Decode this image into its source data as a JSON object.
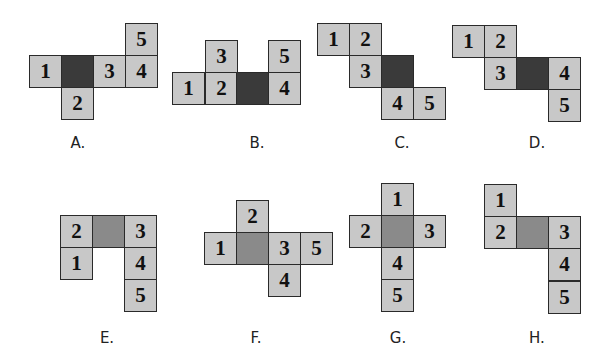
{
  "colors": {
    "face": "#c8c8c8",
    "shaded_dark": "#3a3a3a",
    "shaded_mid": "#8a8a8a",
    "border": "#2a2a2a",
    "background": "#ffffff"
  },
  "figures": [
    {
      "label": "A.",
      "label_pos": [
        78,
        134
      ],
      "squares": [
        {
          "text": "5",
          "x": 125,
          "y": 23,
          "shade": "none"
        },
        {
          "text": "1",
          "x": 29,
          "y": 55,
          "shade": "none"
        },
        {
          "text": "",
          "x": 61,
          "y": 55,
          "shade": "dark"
        },
        {
          "text": "3",
          "x": 93,
          "y": 55,
          "shade": "none"
        },
        {
          "text": "4",
          "x": 125,
          "y": 55,
          "shade": "none"
        },
        {
          "text": "2",
          "x": 61,
          "y": 87,
          "shade": "none"
        }
      ]
    },
    {
      "label": "B.",
      "label_pos": [
        257,
        134
      ],
      "squares": [
        {
          "text": "3",
          "x": 205,
          "y": 40,
          "shade": "none"
        },
        {
          "text": "5",
          "x": 268,
          "y": 40,
          "shade": "none"
        },
        {
          "text": "1",
          "x": 172,
          "y": 72,
          "shade": "none"
        },
        {
          "text": "2",
          "x": 205,
          "y": 72,
          "shade": "none"
        },
        {
          "text": "",
          "x": 236,
          "y": 72,
          "shade": "dark"
        },
        {
          "text": "4",
          "x": 268,
          "y": 72,
          "shade": "none"
        }
      ]
    },
    {
      "label": "C.",
      "label_pos": [
        402,
        134
      ],
      "squares": [
        {
          "text": "1",
          "x": 317,
          "y": 23,
          "shade": "none"
        },
        {
          "text": "2",
          "x": 349,
          "y": 23,
          "shade": "none"
        },
        {
          "text": "3",
          "x": 349,
          "y": 55,
          "shade": "none"
        },
        {
          "text": "",
          "x": 381,
          "y": 55,
          "shade": "dark"
        },
        {
          "text": "4",
          "x": 381,
          "y": 87,
          "shade": "none"
        },
        {
          "text": "5",
          "x": 413,
          "y": 87,
          "shade": "none"
        }
      ]
    },
    {
      "label": "D.",
      "label_pos": [
        537,
        134
      ],
      "squares": [
        {
          "text": "1",
          "x": 452,
          "y": 25,
          "shade": "none"
        },
        {
          "text": "2",
          "x": 484,
          "y": 25,
          "shade": "none"
        },
        {
          "text": "3",
          "x": 484,
          "y": 57,
          "shade": "none"
        },
        {
          "text": "",
          "x": 516,
          "y": 57,
          "shade": "dark"
        },
        {
          "text": "4",
          "x": 548,
          "y": 57,
          "shade": "none"
        },
        {
          "text": "5",
          "x": 548,
          "y": 89,
          "shade": "none"
        }
      ]
    },
    {
      "label": "E.",
      "label_pos": [
        107,
        329
      ],
      "squares": [
        {
          "text": "2",
          "x": 60,
          "y": 215,
          "shade": "none"
        },
        {
          "text": "",
          "x": 92,
          "y": 215,
          "shade": "mid"
        },
        {
          "text": "3",
          "x": 124,
          "y": 215,
          "shade": "none"
        },
        {
          "text": "1",
          "x": 60,
          "y": 247,
          "shade": "none"
        },
        {
          "text": "4",
          "x": 124,
          "y": 247,
          "shade": "none"
        },
        {
          "text": "5",
          "x": 124,
          "y": 279,
          "shade": "none"
        }
      ]
    },
    {
      "label": "F.",
      "label_pos": [
        256,
        329
      ],
      "squares": [
        {
          "text": "2",
          "x": 236,
          "y": 200,
          "shade": "none"
        },
        {
          "text": "1",
          "x": 204,
          "y": 232,
          "shade": "none"
        },
        {
          "text": "",
          "x": 236,
          "y": 232,
          "shade": "mid"
        },
        {
          "text": "3",
          "x": 268,
          "y": 232,
          "shade": "none"
        },
        {
          "text": "5",
          "x": 300,
          "y": 232,
          "shade": "none"
        },
        {
          "text": "4",
          "x": 268,
          "y": 264,
          "shade": "none"
        }
      ]
    },
    {
      "label": "G.",
      "label_pos": [
        398,
        329
      ],
      "squares": [
        {
          "text": "1",
          "x": 381,
          "y": 183,
          "shade": "none"
        },
        {
          "text": "2",
          "x": 349,
          "y": 215,
          "shade": "none"
        },
        {
          "text": "",
          "x": 381,
          "y": 215,
          "shade": "mid"
        },
        {
          "text": "3",
          "x": 413,
          "y": 215,
          "shade": "none"
        },
        {
          "text": "4",
          "x": 381,
          "y": 247,
          "shade": "none"
        },
        {
          "text": "5",
          "x": 381,
          "y": 279,
          "shade": "none"
        }
      ]
    },
    {
      "label": "H.",
      "label_pos": [
        537,
        329
      ],
      "squares": [
        {
          "text": "1",
          "x": 484,
          "y": 184,
          "shade": "none"
        },
        {
          "text": "2",
          "x": 484,
          "y": 216,
          "shade": "none"
        },
        {
          "text": "",
          "x": 516,
          "y": 216,
          "shade": "mid"
        },
        {
          "text": "3",
          "x": 548,
          "y": 216,
          "shade": "none"
        },
        {
          "text": "4",
          "x": 548,
          "y": 248,
          "shade": "none"
        },
        {
          "text": "5",
          "x": 548,
          "y": 281,
          "shade": "none"
        }
      ]
    }
  ]
}
